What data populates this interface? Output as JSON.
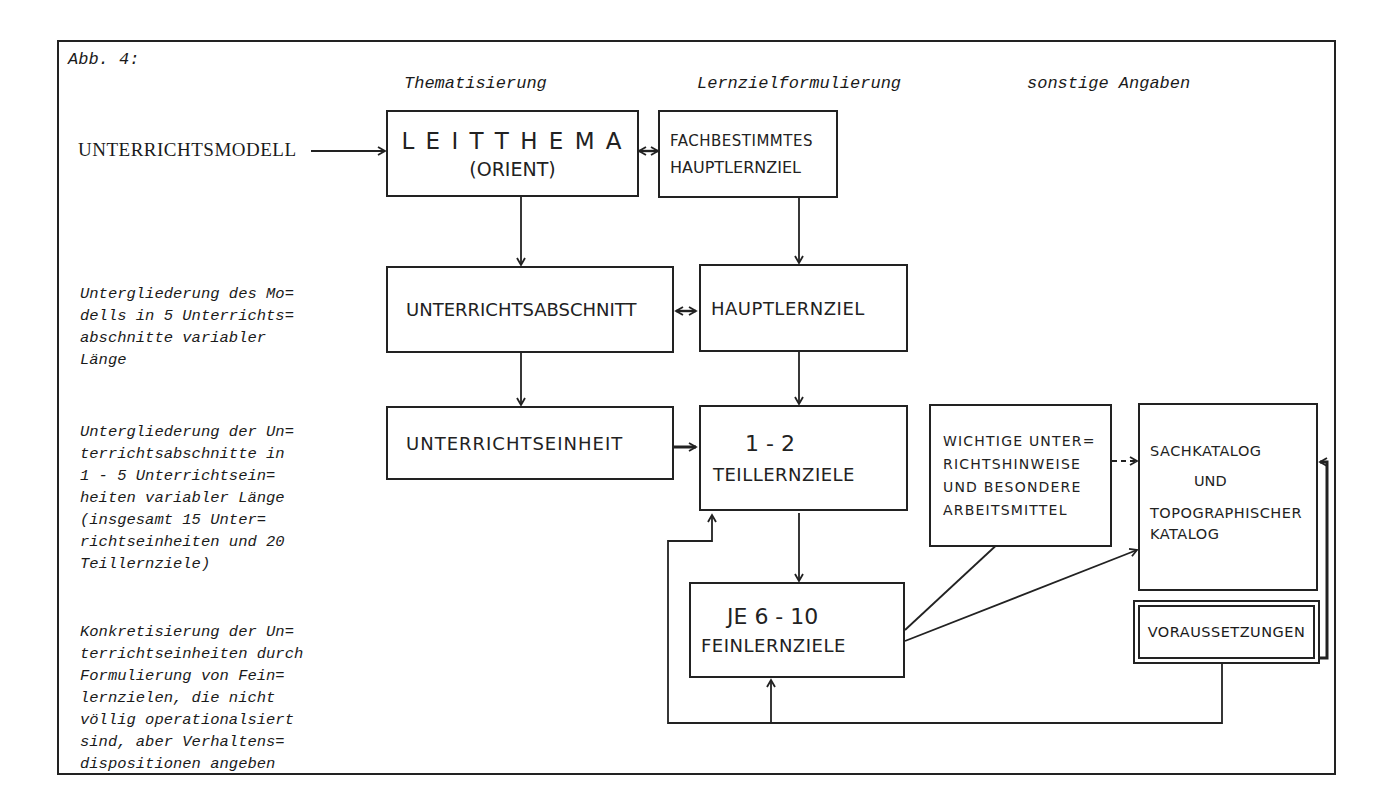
{
  "figure": {
    "label": "Abb. 4:",
    "column_headers": {
      "thematisierung": "Thematisierung",
      "lernziel": "Lernzielformulierung",
      "sonstige": "sonstige Angaben"
    },
    "entry_label": "UNTERRICHTSMODELL"
  },
  "descriptions": [
    "Untergliederung des Mo=\ndells in 5 Unterrichts=\nabschnitte variabler\nLänge",
    "Untergliederung der Un=\nterrichtsabschnitte in\n1 - 5 Unterrichtsein=\nheiten variabler Länge\n(insgesamt 15 Unter=\nrichtseinheiten und 20\nTeillernziele)",
    "Konkretisierung der Un=\nterrichtseinheiten durch\nFormulierung von Fein=\nlernzielen, die nicht\nvöllig operationalsiert\nsind, aber Verhaltens=\ndispositionen angeben"
  ],
  "boxes": {
    "leitthema": {
      "line1": "L E I T T H E M A",
      "line2": "(ORIENT)"
    },
    "fachbestimmtes": {
      "line1": "FACHBESTIMMTES",
      "line2": "HAUPTLERNZIEL"
    },
    "abschnitt": {
      "line1": "UNTERRICHTSABSCHNITT"
    },
    "hauptlernziel": {
      "line1": "HAUPTLERNZIEL"
    },
    "einheit": {
      "line1": "UNTERRICHTSEINHEIT"
    },
    "teillernziele": {
      "line1": "1 - 2",
      "line2": "TEILLERNZIELE"
    },
    "feinlernziele": {
      "line1": "JE 6 - 10",
      "line2": "FEINLERNZIELE"
    },
    "hinweise": {
      "text": "WICHTIGE UNTER=\nRICHTSHINWEISE\nUND BESONDERE\nARBEITSMITTEL"
    },
    "katalog": {
      "line1": "SACHKATALOG",
      "line2": "UND",
      "line3": "TOPOGRAPHISCHER\nKATALOG"
    },
    "voraussetzungen": {
      "text": "VORAUSSETZUNGEN"
    }
  },
  "colors": {
    "ink": "#222222",
    "paper": "#ffffff"
  }
}
